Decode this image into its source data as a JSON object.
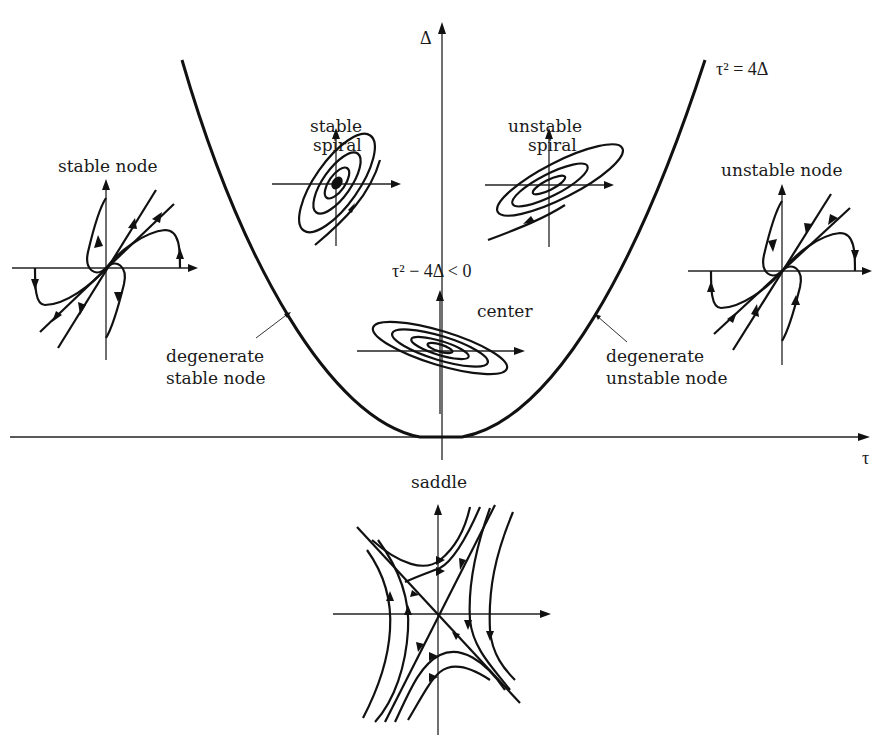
{
  "figure": {
    "type": "trace-determinant classification diagram",
    "axes": {
      "vertical_label": "Δ",
      "horizontal_label": "τ"
    },
    "parabola_label": "τ² = 4Δ",
    "region_label": "τ² − 4Δ < 0",
    "regions": [
      {
        "id": "stable_node",
        "label": "stable node"
      },
      {
        "id": "stable_spiral",
        "label_line1": "stable",
        "label_line2": "spiral"
      },
      {
        "id": "unstable_spiral",
        "label_line1": "unstable",
        "label_line2": "spiral"
      },
      {
        "id": "unstable_node",
        "label": "unstable node"
      },
      {
        "id": "center",
        "label": "center"
      },
      {
        "id": "degenerate_stable_node",
        "label_line1": "degenerate",
        "label_line2": "stable node"
      },
      {
        "id": "degenerate_unstable_node",
        "label_line1": "degenerate",
        "label_line2": "unstable node"
      },
      {
        "id": "saddle",
        "label": "saddle"
      }
    ]
  },
  "colors": {
    "ink": "#111111",
    "background": "#ffffff"
  }
}
